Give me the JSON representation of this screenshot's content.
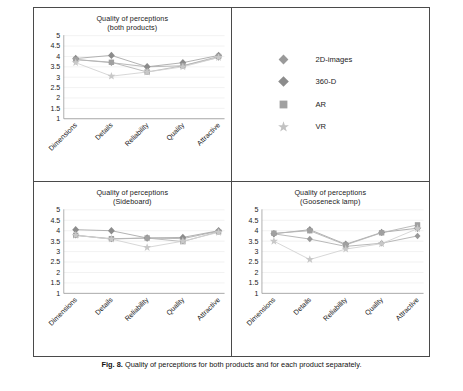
{
  "figure": {
    "caption_label": "Fig. 8.",
    "caption_text": "Quality of perceptions for both products and for each product separately."
  },
  "legend": {
    "items": [
      {
        "label": "2D-images",
        "marker": "diamond-marker-icon",
        "color": "#9a9a9a"
      },
      {
        "label": "360-D",
        "marker": "diamond-marker-icon",
        "color": "#8c8c8c"
      },
      {
        "label": "AR",
        "marker": "square-marker-icon",
        "color": "#a0a0a0"
      },
      {
        "label": "VR",
        "marker": "star-marker-icon",
        "color": "#c2c2c2"
      }
    ]
  },
  "chart_data": [
    {
      "type": "line",
      "panel": "top-left",
      "title": "Quality of perceptions",
      "subtitle": "(both products)",
      "categories": [
        "Dimensions",
        "Details",
        "Reliability",
        "Quality",
        "Attractive"
      ],
      "ylim": [
        1,
        5
      ],
      "yticks": [
        "1",
        "1.5",
        "2",
        "2.5",
        "3",
        "3.5",
        "4",
        "4.5",
        "5"
      ],
      "xlabel": "",
      "ylabel": "",
      "grid": true,
      "legend_position": "external-top-right",
      "series": [
        {
          "name": "2D-images",
          "values": [
            3.85,
            3.7,
            3.5,
            3.55,
            3.95
          ]
        },
        {
          "name": "360-D",
          "values": [
            3.9,
            4.05,
            3.5,
            3.7,
            4.05
          ]
        },
        {
          "name": "AR",
          "values": [
            3.85,
            3.72,
            3.25,
            3.55,
            4.0
          ]
        },
        {
          "name": "VR",
          "values": [
            3.7,
            3.05,
            3.25,
            3.5,
            3.95
          ]
        }
      ]
    },
    {
      "type": "line",
      "panel": "bottom-left",
      "title": "Quality of perceptions",
      "subtitle": "(Sideboard)",
      "categories": [
        "Dimensions",
        "Details",
        "Reliability",
        "Quality",
        "Attractive"
      ],
      "ylim": [
        1,
        5
      ],
      "yticks": [
        "1",
        "1.5",
        "2",
        "2.5",
        "3",
        "3.5",
        "4",
        "4.5",
        "5"
      ],
      "xlabel": "",
      "ylabel": "",
      "grid": true,
      "legend_position": "none",
      "series": [
        {
          "name": "2D-images",
          "values": [
            3.78,
            3.6,
            3.65,
            3.62,
            3.98
          ]
        },
        {
          "name": "360-D",
          "values": [
            4.05,
            4.0,
            3.65,
            3.68,
            4.0
          ]
        },
        {
          "name": "AR",
          "values": [
            3.78,
            3.62,
            3.65,
            3.48,
            3.95
          ]
        },
        {
          "name": "VR",
          "values": [
            3.78,
            3.6,
            3.2,
            3.5,
            3.92
          ]
        }
      ]
    },
    {
      "type": "line",
      "panel": "bottom-right",
      "title": "Quality of perceptions",
      "subtitle": "(Gooseneck lamp)",
      "categories": [
        "Dimensions",
        "Details",
        "Reliability",
        "Quality",
        "Attractive"
      ],
      "ylim": [
        1,
        5
      ],
      "yticks": [
        "1",
        "1.5",
        "2",
        "2.5",
        "3",
        "3.5",
        "4",
        "4.5",
        "5"
      ],
      "xlabel": "",
      "ylabel": "",
      "grid": true,
      "legend_position": "none",
      "series": [
        {
          "name": "2D-images",
          "values": [
            3.85,
            3.6,
            3.25,
            3.4,
            3.75
          ]
        },
        {
          "name": "360-D",
          "values": [
            3.85,
            4.05,
            3.35,
            3.92,
            4.12
          ]
        },
        {
          "name": "AR",
          "values": [
            3.88,
            4.0,
            3.32,
            3.9,
            4.28
          ]
        },
        {
          "name": "VR",
          "values": [
            3.5,
            2.62,
            3.12,
            3.38,
            4.1
          ]
        }
      ]
    }
  ]
}
